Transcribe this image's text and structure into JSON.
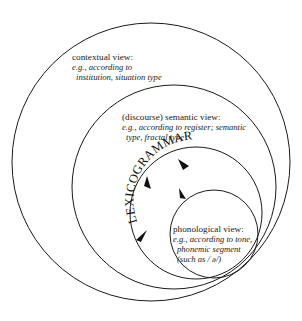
{
  "diagram": {
    "type": "nested-circles",
    "circles": [
      {
        "id": "contextual",
        "title": "contextual view:",
        "line1": "e.g., according to",
        "line2": "institution, situation type"
      },
      {
        "id": "semantic",
        "title": "(discourse) semantic view:",
        "line1": "e.g., according to register; semantic",
        "line2": "type, fractal type"
      },
      {
        "id": "lexicogrammar",
        "title": "LEXICOGRAMMAR"
      },
      {
        "id": "phonological",
        "title": "phonological view:",
        "line1": "e.g., according to tone,",
        "line2": "phonemic segment",
        "line3": "(such as / ə/)"
      }
    ],
    "arrowheads": 4,
    "colors": {
      "stroke": "#1a1a1a",
      "background": "#ffffff"
    }
  }
}
